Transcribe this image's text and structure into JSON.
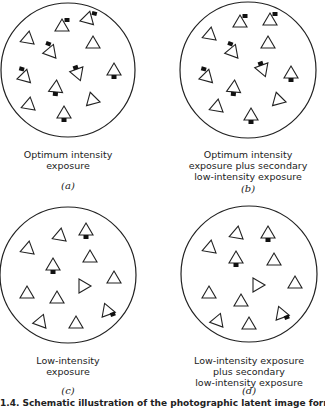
{
  "panels": [
    {
      "id": "a",
      "label_lines": [
        "Optimum intensity",
        "exposure"
      ],
      "subfigure": "(a)",
      "circle": {
        "cx": 68,
        "cy": 70,
        "r": 67
      },
      "grains": [
        {
          "x": 28,
          "y": 38,
          "rot": 10,
          "dot": null
        },
        {
          "x": 62,
          "y": 26,
          "rot": 0,
          "dot": "tr"
        },
        {
          "x": 88,
          "y": 18,
          "rot": 15,
          "dot": "tr"
        },
        {
          "x": 93,
          "y": 43,
          "rot": 0,
          "dot": null
        },
        {
          "x": 51,
          "y": 51,
          "rot": 20,
          "dot": "tl"
        },
        {
          "x": 25,
          "y": 76,
          "rot": 15,
          "dot": "tl"
        },
        {
          "x": 78,
          "y": 74,
          "rot": 160,
          "dot": "b"
        },
        {
          "x": 56,
          "y": 87,
          "rot": 5,
          "dot": "b"
        },
        {
          "x": 114,
          "y": 70,
          "rot": 0,
          "dot": "b"
        },
        {
          "x": 29,
          "y": 104,
          "rot": 10,
          "dot": null
        },
        {
          "x": 92,
          "y": 99,
          "rot": -15,
          "dot": null
        },
        {
          "x": 64,
          "y": 113,
          "rot": 0,
          "dot": "b"
        }
      ]
    },
    {
      "id": "b",
      "label_lines": [
        "Optimum intensity",
        "exposure plus secondary",
        "low-intensity exposure"
      ],
      "subfigure": "(b)",
      "circle": {
        "cx": 248,
        "cy": 70,
        "r": 68
      },
      "grains": [
        {
          "x": 210,
          "y": 34,
          "rot": 10,
          "dot": null
        },
        {
          "x": 240,
          "y": 22,
          "rot": 0,
          "dot": "tr"
        },
        {
          "x": 270,
          "y": 20,
          "rot": 0,
          "dot": "tr"
        },
        {
          "x": 268,
          "y": 43,
          "rot": 0,
          "dot": null
        },
        {
          "x": 233,
          "y": 51,
          "rot": 20,
          "dot": "tl"
        },
        {
          "x": 207,
          "y": 76,
          "rot": 15,
          "dot": "tl"
        },
        {
          "x": 263,
          "y": 70,
          "rot": 160,
          "dot": "b"
        },
        {
          "x": 234,
          "y": 87,
          "rot": 5,
          "dot": "b"
        },
        {
          "x": 291,
          "y": 73,
          "rot": 0,
          "dot": "b"
        },
        {
          "x": 217,
          "y": 106,
          "rot": 10,
          "dot": null
        },
        {
          "x": 278,
          "y": 99,
          "rot": -15,
          "dot": null
        },
        {
          "x": 251,
          "y": 115,
          "rot": 0,
          "dot": "b"
        }
      ]
    },
    {
      "id": "c",
      "label_lines": [
        "Low-intensity",
        "exposure"
      ],
      "subfigure": "(c)",
      "circle": {
        "cx": 68,
        "cy": 275,
        "r": 68
      },
      "grains": [
        {
          "x": 28,
          "y": 248,
          "rot": 10,
          "dot": null
        },
        {
          "x": 60,
          "y": 235,
          "rot": 10,
          "dot": null
        },
        {
          "x": 86,
          "y": 230,
          "rot": 0,
          "dot": "b"
        },
        {
          "x": 90,
          "y": 257,
          "rot": 0,
          "dot": null
        },
        {
          "x": 53,
          "y": 265,
          "rot": 0,
          "dot": "b"
        },
        {
          "x": 114,
          "y": 278,
          "rot": 0,
          "dot": null
        },
        {
          "x": 27,
          "y": 293,
          "rot": 0,
          "dot": null
        },
        {
          "x": 84,
          "y": 286,
          "rot": 90,
          "dot": null
        },
        {
          "x": 57,
          "y": 298,
          "rot": 0,
          "dot": null
        },
        {
          "x": 107,
          "y": 310,
          "rot": -20,
          "dot": "br"
        },
        {
          "x": 41,
          "y": 321,
          "rot": 20,
          "dot": null
        },
        {
          "x": 76,
          "y": 323,
          "rot": 0,
          "dot": null
        }
      ]
    },
    {
      "id": "d",
      "label_lines": [
        "Low-intensity exposure",
        "plus secondary",
        "low-intensity exposure"
      ],
      "subfigure": "(d)",
      "circle": {
        "cx": 249,
        "cy": 274,
        "r": 68
      },
      "grains": [
        {
          "x": 210,
          "y": 247,
          "rot": 10,
          "dot": null
        },
        {
          "x": 237,
          "y": 233,
          "rot": 10,
          "dot": null
        },
        {
          "x": 268,
          "y": 233,
          "rot": 0,
          "dot": "b"
        },
        {
          "x": 274,
          "y": 260,
          "rot": 0,
          "dot": null
        },
        {
          "x": 236,
          "y": 258,
          "rot": 0,
          "dot": "b"
        },
        {
          "x": 295,
          "y": 283,
          "rot": 0,
          "dot": null
        },
        {
          "x": 209,
          "y": 293,
          "rot": 0,
          "dot": null
        },
        {
          "x": 258,
          "y": 285,
          "rot": 90,
          "dot": null
        },
        {
          "x": 241,
          "y": 301,
          "rot": 0,
          "dot": null
        },
        {
          "x": 281,
          "y": 313,
          "rot": -20,
          "dot": "br"
        },
        {
          "x": 218,
          "y": 320,
          "rot": 20,
          "dot": null
        },
        {
          "x": 249,
          "y": 324,
          "rot": 0,
          "dot": null
        }
      ]
    }
  ],
  "caption": "1.4. Schematic illustration of the photographic latent image formation"
}
